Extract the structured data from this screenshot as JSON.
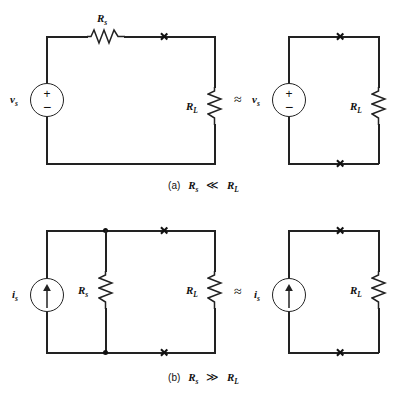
{
  "figure": {
    "ink_color": "#222222",
    "background": "#ffffff"
  },
  "symbols": {
    "approx_equal": "≈",
    "much_less": "≪",
    "much_greater": "≫",
    "plus": "+",
    "minus": "−"
  },
  "panels": [
    {
      "id": "a",
      "caption_tag": "(a)",
      "caption_left": "R",
      "caption_left_sub": "s",
      "caption_relation": "≪",
      "caption_right": "R",
      "caption_right_sub": "L",
      "caption_text": "(a)  Rₛ ≪ Rₗ",
      "left_circuit": {
        "name": "practical-voltage-source-with-load",
        "source": {
          "type": "voltage-source",
          "label": "v",
          "label_sub": "s",
          "polarity_top": "+",
          "polarity_bottom": "−"
        },
        "series_resistor": {
          "label": "R",
          "label_sub": "s",
          "orientation": "horizontal"
        },
        "load_resistor": {
          "label": "R",
          "label_sub": "L",
          "orientation": "vertical"
        },
        "cross_marks": 1
      },
      "right_circuit": {
        "name": "ideal-voltage-source-with-load",
        "source": {
          "type": "voltage-source",
          "label": "v",
          "label_sub": "s",
          "polarity_top": "+",
          "polarity_bottom": "−"
        },
        "load_resistor": {
          "label": "R",
          "label_sub": "L",
          "orientation": "vertical"
        },
        "cross_marks": 2
      }
    },
    {
      "id": "b",
      "caption_tag": "(b)",
      "caption_left": "R",
      "caption_left_sub": "s",
      "caption_relation": "≫",
      "caption_right": "R",
      "caption_right_sub": "L",
      "caption_text": "(b)  Rₛ ≫ Rₗ",
      "left_circuit": {
        "name": "practical-current-source-with-load",
        "source": {
          "type": "current-source",
          "label": "i",
          "label_sub": "s",
          "arrow_direction": "up"
        },
        "parallel_resistor": {
          "label": "R",
          "label_sub": "s",
          "orientation": "vertical"
        },
        "load_resistor": {
          "label": "R",
          "label_sub": "L",
          "orientation": "vertical"
        },
        "junction_dots": 2,
        "cross_marks": 2
      },
      "right_circuit": {
        "name": "ideal-current-source-with-load",
        "source": {
          "type": "current-source",
          "label": "i",
          "label_sub": "s",
          "arrow_direction": "up"
        },
        "load_resistor": {
          "label": "R",
          "label_sub": "L",
          "orientation": "vertical"
        },
        "cross_marks": 2
      }
    }
  ]
}
